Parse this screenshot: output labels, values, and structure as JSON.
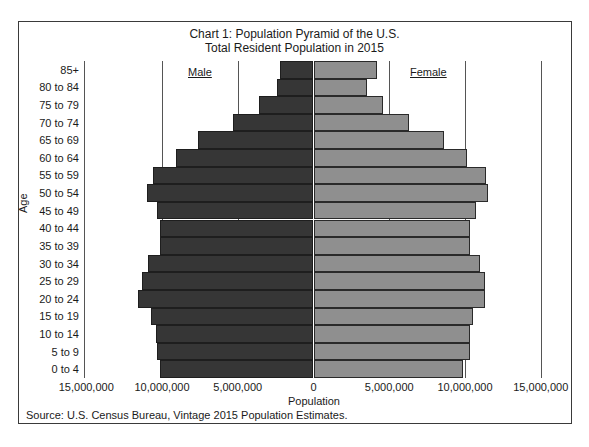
{
  "colors": {
    "male": "#363636",
    "female": "#8f8f8f",
    "frame": "#3a3a3a"
  },
  "chart_data": {
    "type": "bar",
    "orientation": "horizontal",
    "subtype": "population-pyramid",
    "title": "Chart 1: Population Pyramid of the U.S.",
    "subtitle": "Total Resident Population in 2015",
    "xlabel": "Population",
    "ylabel": "Age",
    "xlim": [
      -15000000,
      15000000
    ],
    "x_ticks": [
      "15,000,000",
      "10,000,000",
      "5,000,000",
      "0",
      "5,000,000",
      "10,000,000",
      "15,000,000"
    ],
    "x_tick_values": [
      -15000000,
      -10000000,
      -5000000,
      0,
      5000000,
      10000000,
      15000000
    ],
    "grid": "vertical",
    "legend": [
      "Male",
      "Female"
    ],
    "categories": [
      "85+",
      "80 to 84",
      "75 to 79",
      "70 to 74",
      "65 to 69",
      "60 to 64",
      "55 to 59",
      "50 to 54",
      "45 to 49",
      "40 to 44",
      "35 to 39",
      "30 to 34",
      "25 to 29",
      "20 to 24",
      "15 to 19",
      "10 to 14",
      "5 to 9",
      "0 to 4"
    ],
    "series": [
      {
        "name": "Male",
        "values": [
          2200000,
          2400000,
          3600000,
          5300000,
          7600000,
          9100000,
          10600000,
          11000000,
          10300000,
          10100000,
          10100000,
          10900000,
          11300000,
          11600000,
          10700000,
          10400000,
          10300000,
          10100000
        ]
      },
      {
        "name": "Female",
        "values": [
          4200000,
          3500000,
          4600000,
          6300000,
          8600000,
          10100000,
          11400000,
          11500000,
          10700000,
          10300000,
          10300000,
          11000000,
          11300000,
          11300000,
          10500000,
          10300000,
          10300000,
          9900000
        ]
      }
    ],
    "source": "Source: U.S. Census Bureau, Vintage 2015 Population Estimates."
  }
}
